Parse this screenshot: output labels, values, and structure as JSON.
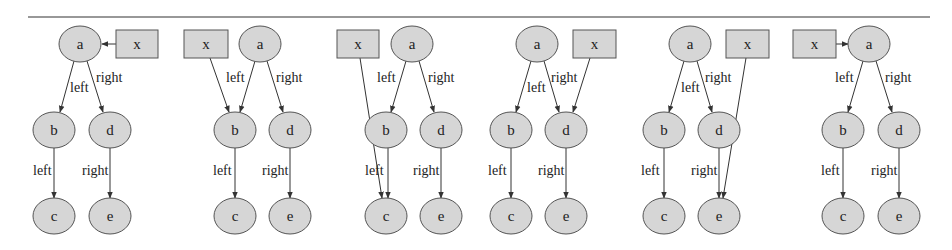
{
  "figure": {
    "rule": {
      "x1": 28,
      "x2": 930,
      "y": 17
    },
    "node_style": {
      "fill": "#d6d6d6",
      "stroke": "#555555",
      "rx": 21,
      "ry": 18,
      "box_h": 28
    },
    "panels": [
      {
        "id": "panel-1",
        "description": "x points to a",
        "nodes": [
          {
            "id": "a",
            "label": "a",
            "shape": "ellipse",
            "cx": 80,
            "cy": 44
          },
          {
            "id": "x",
            "label": "x",
            "shape": "box",
            "x": 116,
            "y": 30,
            "w": 42
          },
          {
            "id": "b",
            "label": "b",
            "shape": "ellipse",
            "cx": 54,
            "cy": 130
          },
          {
            "id": "d",
            "label": "d",
            "shape": "ellipse",
            "cx": 110,
            "cy": 130
          },
          {
            "id": "c",
            "label": "c",
            "shape": "ellipse",
            "cx": 54,
            "cy": 216
          },
          {
            "id": "e",
            "label": "e",
            "shape": "ellipse",
            "cx": 110,
            "cy": 216
          }
        ],
        "edges": [
          {
            "from": "a",
            "to": "b",
            "label": "left",
            "x1": 74,
            "y1": 61,
            "x2": 60,
            "y2": 112,
            "lx": 70,
            "ly": 92
          },
          {
            "from": "a",
            "to": "d",
            "label": "right",
            "x1": 87,
            "y1": 61,
            "x2": 103,
            "y2": 112,
            "lx": 96,
            "ly": 82
          },
          {
            "from": "b",
            "to": "c",
            "label": "left",
            "x1": 54,
            "y1": 148,
            "x2": 54,
            "y2": 198,
            "lx": 33,
            "ly": 175
          },
          {
            "from": "d",
            "to": "e",
            "label": "right",
            "x1": 110,
            "y1": 148,
            "x2": 110,
            "y2": 198,
            "lx": 82,
            "ly": 175
          },
          {
            "from": "x",
            "to": "a",
            "label": "",
            "x1": 116,
            "y1": 44,
            "x2": 102,
            "y2": 44
          }
        ]
      },
      {
        "id": "panel-2",
        "description": "x points to b",
        "nodes": [
          {
            "id": "x",
            "label": "x",
            "shape": "box",
            "x": 184,
            "y": 30,
            "w": 44
          },
          {
            "id": "a",
            "label": "a",
            "shape": "ellipse",
            "cx": 260,
            "cy": 44
          },
          {
            "id": "b",
            "label": "b",
            "shape": "ellipse",
            "cx": 235,
            "cy": 130
          },
          {
            "id": "d",
            "label": "d",
            "shape": "ellipse",
            "cx": 290,
            "cy": 130
          },
          {
            "id": "c",
            "label": "c",
            "shape": "ellipse",
            "cx": 235,
            "cy": 216
          },
          {
            "id": "e",
            "label": "e",
            "shape": "ellipse",
            "cx": 290,
            "cy": 216
          }
        ],
        "edges": [
          {
            "from": "a",
            "to": "b",
            "label": "left",
            "x1": 255,
            "y1": 61,
            "x2": 240,
            "y2": 112,
            "lx": 226,
            "ly": 82
          },
          {
            "from": "a",
            "to": "d",
            "label": "right",
            "x1": 267,
            "y1": 61,
            "x2": 283,
            "y2": 112,
            "lx": 276,
            "ly": 82
          },
          {
            "from": "x",
            "to": "b",
            "label": "",
            "x1": 210,
            "y1": 58,
            "x2": 229,
            "y2": 112
          },
          {
            "from": "b",
            "to": "c",
            "label": "left",
            "x1": 235,
            "y1": 148,
            "x2": 235,
            "y2": 198,
            "lx": 213,
            "ly": 175
          },
          {
            "from": "d",
            "to": "e",
            "label": "right",
            "x1": 290,
            "y1": 148,
            "x2": 290,
            "y2": 198,
            "lx": 262,
            "ly": 175
          }
        ]
      },
      {
        "id": "panel-3",
        "description": "x points to c",
        "nodes": [
          {
            "id": "x",
            "label": "x",
            "shape": "box",
            "x": 337,
            "y": 30,
            "w": 42
          },
          {
            "id": "a",
            "label": "a",
            "shape": "ellipse",
            "cx": 412,
            "cy": 44
          },
          {
            "id": "b",
            "label": "b",
            "shape": "ellipse",
            "cx": 386,
            "cy": 130
          },
          {
            "id": "d",
            "label": "d",
            "shape": "ellipse",
            "cx": 441,
            "cy": 130
          },
          {
            "id": "c",
            "label": "c",
            "shape": "ellipse",
            "cx": 386,
            "cy": 216
          },
          {
            "id": "e",
            "label": "e",
            "shape": "ellipse",
            "cx": 441,
            "cy": 216
          }
        ],
        "edges": [
          {
            "from": "a",
            "to": "b",
            "label": "left",
            "x1": 406,
            "y1": 61,
            "x2": 391,
            "y2": 112,
            "lx": 377,
            "ly": 82
          },
          {
            "from": "a",
            "to": "d",
            "label": "right",
            "x1": 419,
            "y1": 61,
            "x2": 434,
            "y2": 112,
            "lx": 428,
            "ly": 82
          },
          {
            "from": "x",
            "to": "c",
            "label": "",
            "x1": 360,
            "y1": 58,
            "x2": 382,
            "y2": 198
          },
          {
            "from": "b",
            "to": "c",
            "label": "left",
            "x1": 388,
            "y1": 148,
            "x2": 388,
            "y2": 198,
            "lx": 365,
            "ly": 175
          },
          {
            "from": "d",
            "to": "e",
            "label": "right",
            "x1": 441,
            "y1": 148,
            "x2": 441,
            "y2": 198,
            "lx": 413,
            "ly": 175
          }
        ]
      },
      {
        "id": "panel-4",
        "description": "x points to d",
        "nodes": [
          {
            "id": "a",
            "label": "a",
            "shape": "ellipse",
            "cx": 537,
            "cy": 44
          },
          {
            "id": "x",
            "label": "x",
            "shape": "box",
            "x": 573,
            "y": 30,
            "w": 43
          },
          {
            "id": "b",
            "label": "b",
            "shape": "ellipse",
            "cx": 511,
            "cy": 130
          },
          {
            "id": "d",
            "label": "d",
            "shape": "ellipse",
            "cx": 566,
            "cy": 130
          },
          {
            "id": "c",
            "label": "c",
            "shape": "ellipse",
            "cx": 511,
            "cy": 216
          },
          {
            "id": "e",
            "label": "e",
            "shape": "ellipse",
            "cx": 566,
            "cy": 216
          }
        ],
        "edges": [
          {
            "from": "a",
            "to": "b",
            "label": "left",
            "x1": 531,
            "y1": 61,
            "x2": 516,
            "y2": 112,
            "lx": 527,
            "ly": 92
          },
          {
            "from": "a",
            "to": "d",
            "label": "right",
            "x1": 544,
            "y1": 61,
            "x2": 559,
            "y2": 112,
            "lx": 551,
            "ly": 82
          },
          {
            "from": "x",
            "to": "d",
            "label": "",
            "x1": 590,
            "y1": 58,
            "x2": 573,
            "y2": 112
          },
          {
            "from": "b",
            "to": "c",
            "label": "left",
            "x1": 511,
            "y1": 148,
            "x2": 511,
            "y2": 198,
            "lx": 488,
            "ly": 175
          },
          {
            "from": "d",
            "to": "e",
            "label": "right",
            "x1": 566,
            "y1": 148,
            "x2": 566,
            "y2": 198,
            "lx": 538,
            "ly": 175
          }
        ]
      },
      {
        "id": "panel-5",
        "description": "x points to e",
        "nodes": [
          {
            "id": "a",
            "label": "a",
            "shape": "ellipse",
            "cx": 690,
            "cy": 44
          },
          {
            "id": "x",
            "label": "x",
            "shape": "box",
            "x": 726,
            "y": 30,
            "w": 43
          },
          {
            "id": "b",
            "label": "b",
            "shape": "ellipse",
            "cx": 664,
            "cy": 130
          },
          {
            "id": "d",
            "label": "d",
            "shape": "ellipse",
            "cx": 719,
            "cy": 130
          },
          {
            "id": "c",
            "label": "c",
            "shape": "ellipse",
            "cx": 664,
            "cy": 216
          },
          {
            "id": "e",
            "label": "e",
            "shape": "ellipse",
            "cx": 719,
            "cy": 216
          }
        ],
        "edges": [
          {
            "from": "a",
            "to": "b",
            "label": "left",
            "x1": 684,
            "y1": 61,
            "x2": 669,
            "y2": 112,
            "lx": 681,
            "ly": 92
          },
          {
            "from": "a",
            "to": "d",
            "label": "right",
            "x1": 697,
            "y1": 61,
            "x2": 712,
            "y2": 112,
            "lx": 705,
            "ly": 82
          },
          {
            "from": "x",
            "to": "e",
            "label": "",
            "x1": 746,
            "y1": 58,
            "x2": 723,
            "y2": 198
          },
          {
            "from": "b",
            "to": "c",
            "label": "left",
            "x1": 664,
            "y1": 148,
            "x2": 664,
            "y2": 198,
            "lx": 641,
            "ly": 175
          },
          {
            "from": "d",
            "to": "e",
            "label": "right",
            "x1": 719,
            "y1": 148,
            "x2": 719,
            "y2": 198,
            "lx": 691,
            "ly": 175
          }
        ]
      },
      {
        "id": "panel-6",
        "description": "x points to a",
        "nodes": [
          {
            "id": "x",
            "label": "x",
            "shape": "box",
            "x": 793,
            "y": 30,
            "w": 43
          },
          {
            "id": "a",
            "label": "a",
            "shape": "ellipse",
            "cx": 869,
            "cy": 44
          },
          {
            "id": "b",
            "label": "b",
            "shape": "ellipse",
            "cx": 843,
            "cy": 130
          },
          {
            "id": "d",
            "label": "d",
            "shape": "ellipse",
            "cx": 899,
            "cy": 130
          },
          {
            "id": "c",
            "label": "c",
            "shape": "ellipse",
            "cx": 843,
            "cy": 216
          },
          {
            "id": "e",
            "label": "e",
            "shape": "ellipse",
            "cx": 899,
            "cy": 216
          }
        ],
        "edges": [
          {
            "from": "x",
            "to": "a",
            "label": "",
            "x1": 836,
            "y1": 44,
            "x2": 848,
            "y2": 44
          },
          {
            "from": "a",
            "to": "b",
            "label": "left",
            "x1": 863,
            "y1": 61,
            "x2": 848,
            "y2": 112,
            "lx": 835,
            "ly": 82
          },
          {
            "from": "a",
            "to": "d",
            "label": "right",
            "x1": 876,
            "y1": 61,
            "x2": 892,
            "y2": 112,
            "lx": 885,
            "ly": 82
          },
          {
            "from": "b",
            "to": "c",
            "label": "left",
            "x1": 843,
            "y1": 148,
            "x2": 843,
            "y2": 198,
            "lx": 821,
            "ly": 175
          },
          {
            "from": "d",
            "to": "e",
            "label": "right",
            "x1": 899,
            "y1": 148,
            "x2": 899,
            "y2": 198,
            "lx": 871,
            "ly": 175
          }
        ]
      }
    ]
  }
}
